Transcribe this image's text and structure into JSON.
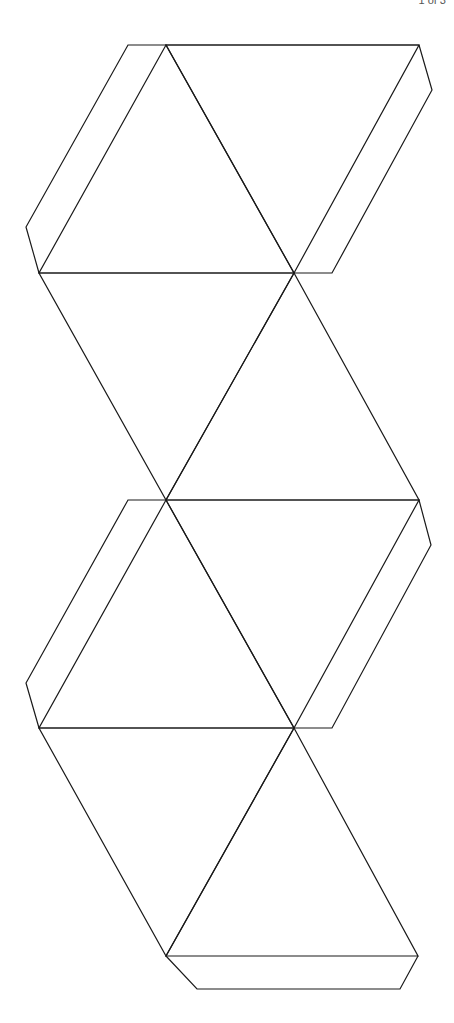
{
  "page": {
    "marker_text": "1 of 3"
  },
  "diagram": {
    "stroke_color": "#1a1a1a",
    "background": "#ffffff",
    "faces": 8,
    "tabs": 5
  }
}
